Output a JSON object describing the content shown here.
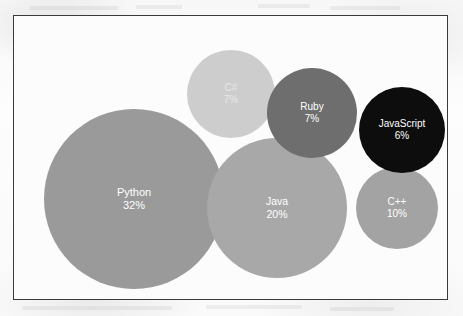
{
  "page": {
    "background_color": "#fbfbfb",
    "frame_border_color": "#3a3a3a",
    "plot_background_color": "#fcfcfc"
  },
  "chart_data": {
    "type": "bubble",
    "title": "",
    "subtitle": "",
    "xlabel": "",
    "ylabel": "",
    "grid": false,
    "legend": "none",
    "unit": "%",
    "categories": [
      "Python",
      "Java",
      "C++",
      "C#",
      "Ruby",
      "JavaScript"
    ],
    "values": [
      32,
      20,
      10,
      7,
      7,
      6
    ],
    "points": [
      {
        "label": "Python",
        "value": 32,
        "value_text": "32%",
        "color": "#9a9a9a",
        "text_color": "#ffffff",
        "cx": 120,
        "cy": 183,
        "r": 90
      },
      {
        "label": "Java",
        "value": 20,
        "value_text": "20%",
        "color": "#a8a8a8",
        "text_color": "#ffffff",
        "cx": 263,
        "cy": 192,
        "r": 70
      },
      {
        "label": "C++",
        "value": 10,
        "value_text": "10%",
        "color": "#a3a3a3",
        "text_color": "#ffffff",
        "cx": 383,
        "cy": 192,
        "r": 41
      },
      {
        "label": "C#",
        "value": 7,
        "value_text": "7%",
        "color": "#cdcdcd",
        "text_color": "#e8e8e8",
        "cx": 217,
        "cy": 78,
        "r": 44
      },
      {
        "label": "Ruby",
        "value": 7,
        "value_text": "7%",
        "color": "#6e6e6e",
        "text_color": "#ffffff",
        "cx": 298,
        "cy": 97,
        "r": 45
      },
      {
        "label": "JavaScript",
        "value": 6,
        "value_text": "6%",
        "color": "#0d0d0d",
        "text_color": "#ffffff",
        "cx": 388,
        "cy": 114,
        "r": 43
      }
    ]
  }
}
